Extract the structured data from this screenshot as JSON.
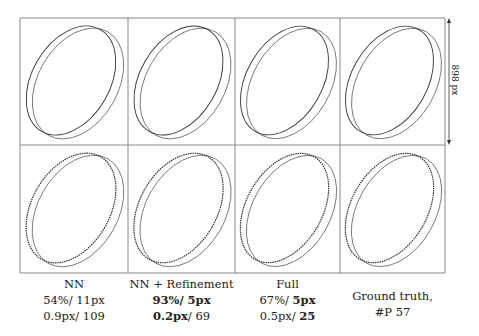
{
  "figure": {
    "grid": {
      "rows": 2,
      "cols": 4,
      "left": 20,
      "top": 18,
      "col_edges": [
        20,
        128,
        235,
        340,
        445
      ],
      "row_edges": [
        18,
        145,
        273
      ]
    },
    "scale_bar": {
      "label": "898 px",
      "x": 449,
      "y1": 18,
      "y2": 145
    },
    "row_labels": [
      "predicted contour",
      "predicted contour (sampled points)"
    ],
    "columns": [
      {
        "title": "NN",
        "line1": [
          {
            "text": "54%/ ",
            "bold": false
          },
          {
            "text": "11px",
            "bold": false
          }
        ],
        "line2": [
          {
            "text": "0.9px/ ",
            "bold": false
          },
          {
            "text": "109",
            "bold": false
          }
        ]
      },
      {
        "title": "NN + Refinement",
        "line1": [
          {
            "text": "93%/ ",
            "bold": true
          },
          {
            "text": "5px",
            "bold": true
          }
        ],
        "line2": [
          {
            "text": "0.2px",
            "bold": true
          },
          {
            "text": "/ 69",
            "bold": false
          }
        ]
      },
      {
        "title": "Full",
        "line1": [
          {
            "text": "67%/ ",
            "bold": false
          },
          {
            "text": "5px",
            "bold": true
          }
        ],
        "line2": [
          {
            "text": "0.5px/ ",
            "bold": false
          },
          {
            "text": "25",
            "bold": true
          }
        ]
      },
      {
        "title": "Ground truth,",
        "line1": [
          {
            "text": "#P 57",
            "bold": false
          }
        ],
        "line2": []
      }
    ],
    "colors": {
      "line": "#555555",
      "border": "#888888",
      "text": "#222222"
    }
  }
}
